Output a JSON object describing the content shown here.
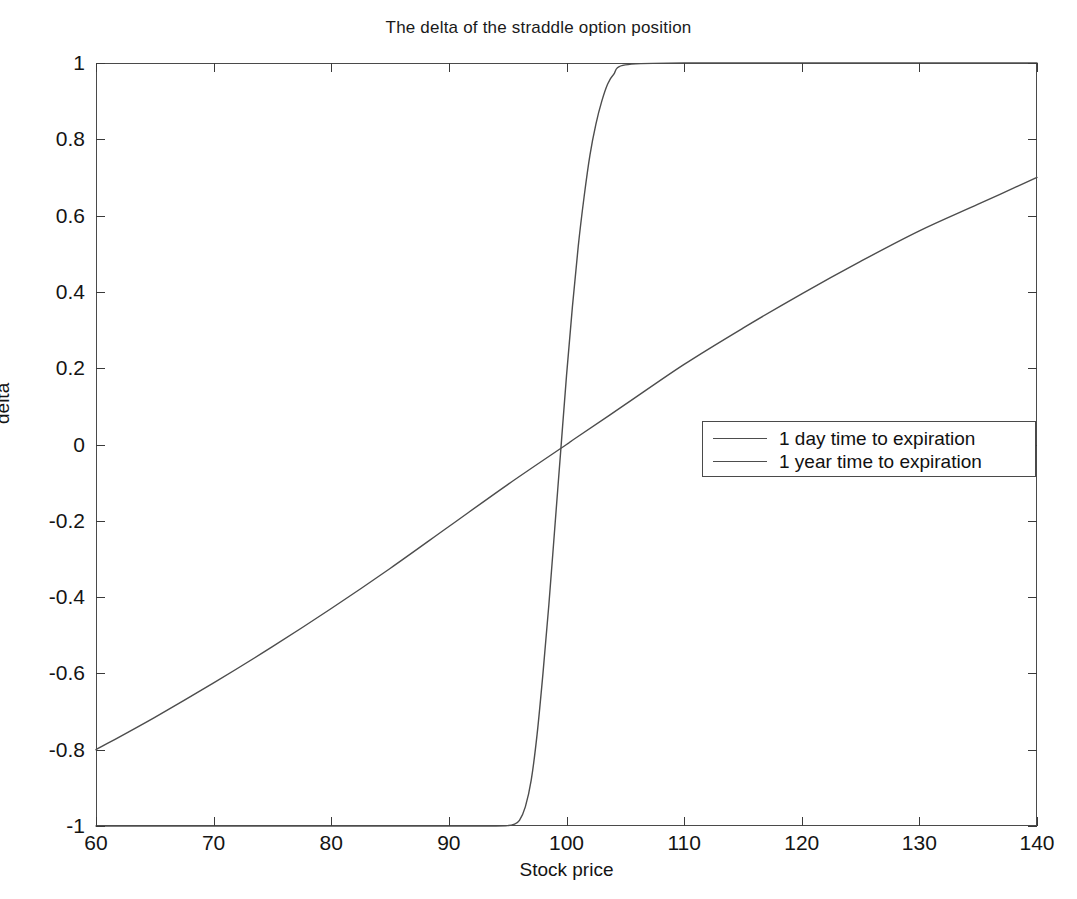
{
  "chart_data": {
    "type": "line",
    "title": "The delta of the straddle option position",
    "xlabel": "Stock price",
    "ylabel": "delta",
    "xlim": [
      60,
      140
    ],
    "ylim": [
      -1,
      1
    ],
    "xticks": [
      60,
      70,
      80,
      90,
      100,
      110,
      120,
      130,
      140
    ],
    "yticks": [
      -1,
      -0.8,
      -0.6,
      -0.4,
      -0.2,
      0,
      0.2,
      0.4,
      0.6,
      0.8,
      1
    ],
    "xtick_labels": [
      "60",
      "70",
      "80",
      "90",
      "100",
      "110",
      "120",
      "130",
      "140"
    ],
    "ytick_labels": [
      "-1",
      "-0.8",
      "-0.6",
      "-0.4",
      "-0.2",
      "0",
      "0.2",
      "0.4",
      "0.6",
      "0.8",
      "1"
    ],
    "grid": false,
    "legend_position": "center-right",
    "series": [
      {
        "name": "1 day time to expiration",
        "color": "#4d4d4d",
        "x": [
          60,
          70,
          80,
          85,
          90,
          92,
          94,
          95,
          95.5,
          96,
          96.5,
          97,
          97.5,
          98,
          98.5,
          99,
          99.5,
          100,
          100.5,
          101,
          101.5,
          102,
          102.5,
          103,
          103.5,
          104,
          105,
          110,
          120,
          130,
          140
        ],
        "y": [
          -1,
          -1,
          -1,
          -1,
          -1,
          -1,
          -1,
          -0.999,
          -0.996,
          -0.985,
          -0.95,
          -0.88,
          -0.76,
          -0.6,
          -0.42,
          -0.22,
          -0.02,
          0.18,
          0.36,
          0.52,
          0.65,
          0.76,
          0.84,
          0.9,
          0.945,
          0.97,
          0.995,
          1,
          1,
          1,
          1
        ]
      },
      {
        "name": "1 year time to expiration",
        "color": "#4d4d4d",
        "x": [
          60,
          65,
          70,
          75,
          80,
          85,
          90,
          95,
          100,
          100.6,
          105,
          110,
          115,
          120,
          125,
          130,
          135,
          140
        ],
        "y": [
          -0.8,
          -0.715,
          -0.625,
          -0.53,
          -0.43,
          -0.325,
          -0.215,
          -0.105,
          0.0,
          0.013,
          0.105,
          0.21,
          0.305,
          0.395,
          0.48,
          0.56,
          0.63,
          0.7
        ]
      }
    ],
    "annotations": {
      "crossing_point": {
        "x": 100.6,
        "y": 0.34
      }
    }
  },
  "legend": {
    "entries": [
      {
        "label": "1 day time to expiration"
      },
      {
        "label": "1 year time to expiration"
      }
    ]
  }
}
